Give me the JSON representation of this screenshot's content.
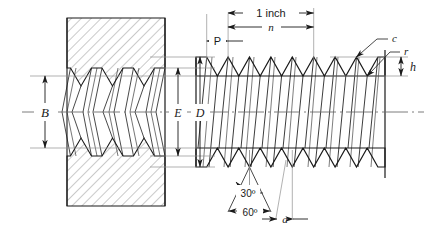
{
  "figure": {
    "background_color": "#ffffff",
    "line_color": "#1a1a1a",
    "thin_line_color": "#7a7a7a",
    "hatch_color": "#8a8a8a"
  },
  "labels": {
    "minor_diameter": "B",
    "pitch_diameter": "E",
    "major_diameter": "D",
    "lead_length": "1 inch",
    "threads_per_inch": "n",
    "pitch": "P",
    "crest": "c",
    "root": "r",
    "thread_height": "h",
    "half_angle": "30º",
    "included_angle": "60º",
    "flat_width": "a"
  },
  "geometry": {
    "centerline_y": 112,
    "nut_left": 67,
    "nut_right": 165,
    "nut_top": 18,
    "nut_bottom": 206,
    "bolt_left": 196,
    "bolt_right": 385,
    "crest_top_y": 57,
    "crest_bottom_y": 167,
    "root_top_y": 76,
    "root_bottom_y": 148,
    "tooth_pitch": 21.4,
    "bolt_tooth_count": 9,
    "nut_tooth_count": 5
  }
}
